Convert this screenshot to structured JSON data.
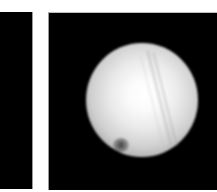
{
  "image": {
    "description": "Two side-by-side grayscale image panels on white background; right panel shows a bright blurred sphere with diagonal streaks and a dark spot near lower-left",
    "colors": {
      "background": "#ffffff",
      "panel": "#000000",
      "sphere_center": "#ffffff",
      "sphere_edge": "#a8a8a8",
      "spot": "#282828"
    },
    "panels": [
      {
        "position": "left",
        "content": "black (cropped)"
      },
      {
        "position": "right",
        "content": "bright sphere"
      }
    ]
  }
}
